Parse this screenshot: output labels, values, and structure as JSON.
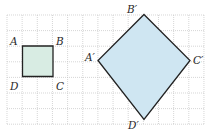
{
  "grid": {
    "x0": 7,
    "y0": 15,
    "cols": 13,
    "rows": 7,
    "cell_w": 15.15,
    "cell_h": 15.6,
    "line_color": "#c4c4c4"
  },
  "square": {
    "name": "ABCD",
    "points": "22.5,46 53,46 53,76.5 22.5,76.5",
    "fill": "#d8ece3",
    "stroke": "#222222",
    "labels": [
      {
        "text": "A",
        "x": 10,
        "y": 45
      },
      {
        "text": "B",
        "x": 56,
        "y": 45
      },
      {
        "text": "C",
        "x": 56,
        "y": 90
      },
      {
        "text": "D",
        "x": 10,
        "y": 90
      }
    ]
  },
  "diamond": {
    "name": "A'B'C'D'",
    "points": "144,14.5 190,60.5 144,119.5 98,60.5",
    "fill": "#cfe6f2",
    "stroke": "#222222",
    "labels": [
      {
        "text": "A′",
        "x": 85,
        "y": 61
      },
      {
        "text": "B′",
        "x": 127,
        "y": 13
      },
      {
        "text": "C′",
        "x": 193,
        "y": 64
      },
      {
        "text": "D′",
        "x": 128,
        "y": 129
      }
    ]
  }
}
